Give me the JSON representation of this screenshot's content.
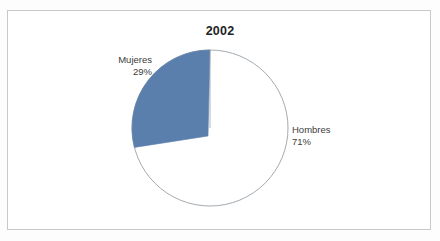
{
  "chart": {
    "title": "2002"
  },
  "labels": {
    "mujeres": {
      "name": "Mujeres",
      "percent": "29%"
    },
    "hombres": {
      "name": "Hombres",
      "percent": "71%"
    }
  },
  "colors": {
    "mujeres_slice": "#5b7fad",
    "hombres_slice": "#ffffff",
    "slice_outline": "#9aa0a6",
    "frame_border": "#c9c9cc",
    "title_text": "#232323",
    "label_text": "#3b3b3b",
    "background": "#ffffff"
  },
  "chart_data": {
    "type": "pie",
    "title": "2002",
    "subtitle": "",
    "xlabel": "",
    "ylabel": "",
    "categories": [
      "Mujeres",
      "Hombres"
    ],
    "values": [
      29,
      71
    ],
    "value_unit": "percent",
    "data_labels": [
      "29%",
      "71%"
    ],
    "colors": [
      "#5b7fad",
      "#ffffff"
    ],
    "legend": false,
    "legend_position": "none",
    "grid": false,
    "start_angle_deg": 90,
    "direction": "counterclockwise",
    "annotations": [
      {
        "text": "Mujeres",
        "target": "Mujeres",
        "position": "outside-upper-left"
      },
      {
        "text": "29%",
        "target": "Mujeres",
        "position": "outside-upper-left"
      },
      {
        "text": "Hombres",
        "target": "Hombres",
        "position": "outside-right"
      },
      {
        "text": "71%",
        "target": "Hombres",
        "position": "outside-right"
      }
    ]
  }
}
